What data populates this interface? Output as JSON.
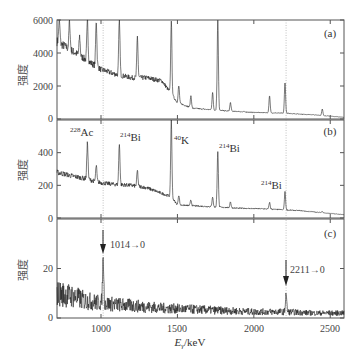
{
  "figure": {
    "xlabel": "Eγ/keV",
    "ylabel": "强度",
    "x_ticks": [
      "1000",
      "1500",
      "2000",
      "2500"
    ],
    "x_tick_values": [
      1000,
      1500,
      2000,
      2500
    ],
    "xlim": [
      712,
      2590
    ],
    "guide_lines_keV": [
      1014,
      2211
    ]
  },
  "chart_data": [
    {
      "type": "line",
      "panel": "(a)",
      "ylabel": "强度",
      "xlabel": "",
      "ylim": [
        0,
        6000
      ],
      "y_ticks": [
        "0",
        "2000",
        "4000",
        "6000"
      ],
      "baseline": {
        "x": [
          712,
          800,
          900,
          1000,
          1100,
          1200,
          1300,
          1400,
          1500,
          1600,
          1800,
          2000,
          2200,
          2400,
          2590
        ],
        "y": [
          4700,
          4200,
          3600,
          3000,
          2700,
          2500,
          2500,
          2300,
          1000,
          650,
          500,
          400,
          350,
          250,
          100
        ]
      },
      "peaks": [
        {
          "x": 727,
          "y": 6000
        },
        {
          "x": 794,
          "y": 6000
        },
        {
          "x": 860,
          "y": 5000
        },
        {
          "x": 911,
          "y": 6000
        },
        {
          "x": 969,
          "y": 6000
        },
        {
          "x": 1120,
          "y": 6000
        },
        {
          "x": 1238,
          "y": 5000
        },
        {
          "x": 1460,
          "y": 6000
        },
        {
          "x": 1509,
          "y": 2000
        },
        {
          "x": 1588,
          "y": 1400
        },
        {
          "x": 1730,
          "y": 1600
        },
        {
          "x": 1764,
          "y": 6000
        },
        {
          "x": 1847,
          "y": 1000
        },
        {
          "x": 2103,
          "y": 1400
        },
        {
          "x": 2204,
          "y": 2200
        },
        {
          "x": 2448,
          "y": 600
        }
      ],
      "annotation": "(a)"
    },
    {
      "type": "line",
      "panel": "(b)",
      "ylabel": "强度",
      "ylim": [
        0,
        600
      ],
      "y_ticks": [
        "0",
        "200",
        "400"
      ],
      "baseline": {
        "x": [
          712,
          800,
          900,
          1000,
          1100,
          1200,
          1300,
          1400,
          1460,
          1500,
          1700,
          1900,
          2100,
          2300,
          2590
        ],
        "y": [
          280,
          260,
          240,
          215,
          205,
          200,
          185,
          150,
          130,
          80,
          70,
          60,
          55,
          45,
          20
        ]
      },
      "peaks": [
        {
          "x": 911,
          "y": 460,
          "label": "228Ac"
        },
        {
          "x": 969,
          "y": 320
        },
        {
          "x": 1120,
          "y": 450,
          "label": "214Bi"
        },
        {
          "x": 1238,
          "y": 290
        },
        {
          "x": 1460,
          "y": 600,
          "label": "40K"
        },
        {
          "x": 1509,
          "y": 140
        },
        {
          "x": 1588,
          "y": 110
        },
        {
          "x": 1730,
          "y": 130
        },
        {
          "x": 1764,
          "y": 410,
          "label": "214Bi"
        },
        {
          "x": 1847,
          "y": 100
        },
        {
          "x": 2103,
          "y": 95
        },
        {
          "x": 2204,
          "y": 160,
          "label": "214Bi"
        },
        {
          "x": 2448,
          "y": 40
        }
      ],
      "labels": [
        {
          "iso": "228",
          "el": "Ac"
        },
        {
          "iso": "214",
          "el": "Bi"
        },
        {
          "iso": "40",
          "el": "K"
        },
        {
          "iso": "214",
          "el": "Bi"
        },
        {
          "iso": "214",
          "el": "Bi"
        }
      ],
      "annotation": "(b)"
    },
    {
      "type": "line",
      "panel": "(c)",
      "ylabel": "强度",
      "ylim": [
        0,
        40
      ],
      "y_ticks": [
        "0",
        "20"
      ],
      "baseline": {
        "x": [
          712,
          800,
          900,
          1000,
          1200,
          1400,
          1600,
          1800,
          2000,
          2200,
          2400,
          2590
        ],
        "y": [
          10,
          9,
          7,
          6,
          5,
          4,
          3.5,
          3,
          2.5,
          2.5,
          2,
          2
        ]
      },
      "peaks": [
        {
          "x": 1014,
          "y": 24,
          "label": "1014→0"
        },
        {
          "x": 2211,
          "y": 10,
          "label": "2211→0"
        }
      ],
      "annotation": "(c)"
    }
  ],
  "labels": {
    "panel_a": "(a)",
    "panel_b": "(b)",
    "panel_c": "(c)",
    "b_ac228_iso": "228",
    "b_ac228_el": "Ac",
    "b_bi214_1_iso": "214",
    "b_bi214_1_el": "Bi",
    "b_k40_iso": "40",
    "b_k40_el": "K",
    "b_bi214_2_iso": "214",
    "b_bi214_2_el": "Bi",
    "b_bi214_3_iso": "214",
    "b_bi214_3_el": "Bi",
    "c_arrow1": "1014→0",
    "c_arrow2": "2211→0",
    "a_y": [
      "0",
      "2000",
      "4000",
      "6000"
    ],
    "b_y": [
      "0",
      "200",
      "400"
    ],
    "c_y": [
      "0",
      "20"
    ],
    "ylabel": "强度",
    "x_ticks": [
      "1000",
      "1500",
      "2000",
      "2500"
    ],
    "xlabel_E": "E",
    "xlabel_sub": "γ",
    "xlabel_unit": "/keV"
  }
}
